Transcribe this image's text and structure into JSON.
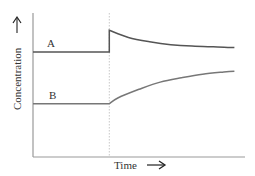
{
  "chart_data": {
    "type": "line",
    "title": "",
    "xlabel": "Time",
    "ylabel": "Concentration",
    "x_arrow": "right-arrow",
    "y_arrow": "up-arrow",
    "xlim": [
      0,
      1
    ],
    "ylim": [
      0,
      1
    ],
    "grid": false,
    "legend": "none",
    "event_marker": {
      "x": 0.36,
      "style": "dotted"
    },
    "series": [
      {
        "name": "A",
        "color": "#555555",
        "x": [
          0,
          0.36,
          0.36,
          0.45,
          0.55,
          0.65,
          0.75,
          0.85,
          0.95
        ],
        "y": [
          0.73,
          0.73,
          0.88,
          0.83,
          0.8,
          0.78,
          0.77,
          0.765,
          0.76
        ]
      },
      {
        "name": "B",
        "color": "#777777",
        "x": [
          0,
          0.36,
          0.4,
          0.5,
          0.6,
          0.7,
          0.8,
          0.9,
          0.95
        ],
        "y": [
          0.37,
          0.37,
          0.41,
          0.47,
          0.52,
          0.55,
          0.575,
          0.59,
          0.595
        ]
      }
    ],
    "annotations": [
      {
        "text": "A",
        "series": "A"
      },
      {
        "text": "B",
        "series": "B"
      }
    ]
  }
}
